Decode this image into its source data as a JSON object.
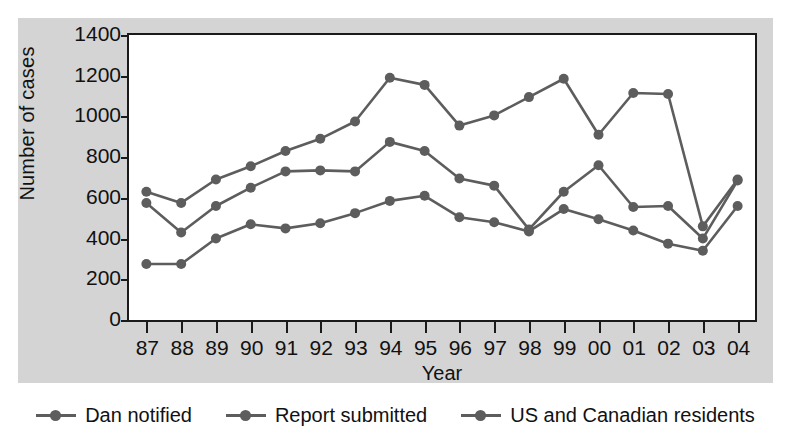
{
  "chart_data": {
    "type": "line",
    "title": "",
    "xlabel": "Year",
    "ylabel": "Number of cases",
    "categories": [
      "87",
      "88",
      "89",
      "90",
      "91",
      "92",
      "93",
      "94",
      "95",
      "96",
      "97",
      "98",
      "99",
      "00",
      "01",
      "02",
      "03",
      "04"
    ],
    "xlim": [
      0,
      17
    ],
    "ylim": [
      0,
      1400
    ],
    "ytick_values": [
      0,
      200,
      400,
      600,
      800,
      1000,
      1200,
      1400
    ],
    "ytick_labels": [
      "0",
      "200",
      "400",
      "600",
      "800",
      "1000",
      "1200",
      "1400"
    ],
    "grid": false,
    "legend_position": "bottom",
    "series": [
      {
        "name": "Dan notified",
        "color": "#5d5d5d",
        "values": [
          630,
          575,
          690,
          755,
          830,
          890,
          975,
          1190,
          1155,
          955,
          1005,
          1095,
          1185,
          910,
          1115,
          1110,
          460,
          690
        ]
      },
      {
        "name": "Report submitted",
        "color": "#5d5d5d",
        "values": [
          575,
          430,
          560,
          650,
          730,
          735,
          730,
          875,
          830,
          695,
          660,
          445,
          630,
          760,
          555,
          560,
          400,
          685
        ]
      },
      {
        "name": "US and Canadian residents",
        "color": "#5d5d5d",
        "values": [
          275,
          275,
          400,
          470,
          450,
          475,
          525,
          585,
          610,
          505,
          480,
          435,
          545,
          495,
          440,
          375,
          340,
          560
        ]
      }
    ]
  },
  "axis": {
    "y_title": "Number of cases",
    "x_title": "Year"
  },
  "legend": {
    "items": [
      {
        "label": "Dan notified",
        "marker": "line-dot-marker"
      },
      {
        "label": "Report submitted",
        "marker": "line-dot-marker"
      },
      {
        "label": "US and Canadian residents",
        "marker": "line-dot-marker"
      }
    ]
  },
  "colors": {
    "series": "#5d5d5d",
    "axis": "#1a1a1a",
    "panel_background": "#d4d4d4",
    "plot_background": "#ffffff"
  }
}
